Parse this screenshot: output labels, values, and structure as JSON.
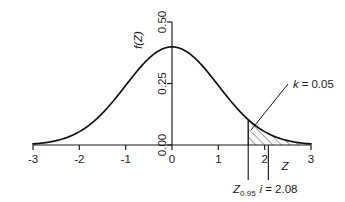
{
  "figure": {
    "kind": "normal-distribution-plot",
    "background_color": "#ffffff",
    "ink_color": "#1a1a1a"
  },
  "axes": {
    "x_axis_label": "Z",
    "y_axis_label": "f(Z)",
    "x_ticks": [
      "-3",
      "-2",
      "-1",
      "0",
      "1",
      "2",
      "3"
    ],
    "y_ticks": [
      "0.00",
      "0.25",
      "0.50"
    ]
  },
  "annotations": {
    "area_label": "k = 0.05",
    "area_label_symbol": "k",
    "area_label_value": "0.05",
    "critical_value_label": "Z",
    "critical_value_subscript": "0.95",
    "observed_symbol": "i",
    "observed_equals": "= 2.08",
    "critical_caption": "Z0.95 i = 2.08"
  },
  "chart_data": {
    "type": "line",
    "title": "",
    "xlabel": "Z",
    "ylabel": "f(Z)",
    "xlim": [
      -3,
      3
    ],
    "ylim": [
      0,
      0.5
    ],
    "xticks": [
      -3,
      -2,
      -1,
      0,
      1,
      2,
      3
    ],
    "yticks": [
      0.0,
      0.25,
      0.5
    ],
    "grid": false,
    "legend": "none",
    "series": [
      {
        "name": "standard normal density",
        "x": [
          -3,
          -2.75,
          -2.5,
          -2.25,
          -2,
          -1.75,
          -1.5,
          -1.25,
          -1,
          -0.75,
          -0.5,
          -0.25,
          0,
          0.25,
          0.5,
          0.75,
          1,
          1.25,
          1.5,
          1.75,
          2,
          2.25,
          2.5,
          2.75,
          3
        ],
        "y": [
          0.0044,
          0.0091,
          0.0175,
          0.0317,
          0.054,
          0.0863,
          0.1295,
          0.1826,
          0.242,
          0.3011,
          0.3521,
          0.3867,
          0.3989,
          0.3867,
          0.3521,
          0.3011,
          0.242,
          0.1826,
          0.1295,
          0.0863,
          0.054,
          0.0317,
          0.0175,
          0.0091,
          0.0044
        ]
      }
    ],
    "shaded_region": {
      "label": "k = 0.05",
      "from": 1.645,
      "to": 3,
      "area": 0.05,
      "fill": "hatched-45deg"
    },
    "vertical_markers": [
      {
        "name": "critical value Z0.95",
        "x": 1.645,
        "label": "Z0.95"
      },
      {
        "name": "observed statistic i",
        "x": 2.08,
        "label": "i = 2.08"
      }
    ]
  }
}
